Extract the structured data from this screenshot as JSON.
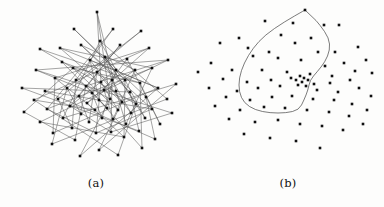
{
  "figure": {
    "background_color": "#fdfdfc",
    "node_color": "#101010",
    "edge_color": "#5a5a5a",
    "curve_color": "#444444",
    "caption_color": "#101010",
    "panels": [
      {
        "id": "a",
        "caption": "(a)",
        "description": "dense node-link hairball graph",
        "has_edges": true,
        "has_boundary_curve": false
      },
      {
        "id": "b",
        "caption": "(b)",
        "description": "scatter of same nodes with single closed boundary contour",
        "has_edges": false,
        "has_boundary_curve": true
      }
    ]
  },
  "chart_data": [
    {
      "type": "scatter",
      "panel": "a",
      "title": "(a)",
      "xlabel": "",
      "ylabel": "",
      "xlim": [
        0,
        192
      ],
      "ylim": [
        0,
        182
      ],
      "grid": false,
      "legend": null,
      "marker": "square",
      "marker_size": 2.6,
      "node_count": 78,
      "edge_count": 96,
      "nodes": [
        [
          97,
          12
        ],
        [
          74,
          29
        ],
        [
          113,
          29
        ],
        [
          141,
          31
        ],
        [
          40,
          49
        ],
        [
          60,
          48
        ],
        [
          81,
          45
        ],
        [
          100,
          41
        ],
        [
          120,
          45
        ],
        [
          149,
          48
        ],
        [
          62,
          62
        ],
        [
          36,
          70
        ],
        [
          73,
          68
        ],
        [
          90,
          60
        ],
        [
          105,
          57
        ],
        [
          127,
          59
        ],
        [
          168,
          60
        ],
        [
          55,
          78
        ],
        [
          76,
          80
        ],
        [
          97,
          72
        ],
        [
          116,
          70
        ],
        [
          135,
          70
        ],
        [
          152,
          68
        ],
        [
          22,
          88
        ],
        [
          45,
          91
        ],
        [
          67,
          88
        ],
        [
          86,
          86
        ],
        [
          101,
          82
        ],
        [
          112,
          80
        ],
        [
          125,
          80
        ],
        [
          140,
          83
        ],
        [
          158,
          88
        ],
        [
          176,
          84
        ],
        [
          34,
          100
        ],
        [
          58,
          99
        ],
        [
          79,
          96
        ],
        [
          92,
          93
        ],
        [
          104,
          90
        ],
        [
          116,
          91
        ],
        [
          130,
          92
        ],
        [
          146,
          97
        ],
        [
          167,
          99
        ],
        [
          24,
          112
        ],
        [
          47,
          109
        ],
        [
          70,
          106
        ],
        [
          87,
          103
        ],
        [
          99,
          100
        ],
        [
          110,
          99
        ],
        [
          122,
          102
        ],
        [
          136,
          104
        ],
        [
          152,
          109
        ],
        [
          172,
          113
        ],
        [
          40,
          122
        ],
        [
          63,
          118
        ],
        [
          81,
          114
        ],
        [
          95,
          110
        ],
        [
          107,
          108
        ],
        [
          118,
          110
        ],
        [
          131,
          113
        ],
        [
          145,
          118
        ],
        [
          160,
          124
        ],
        [
          53,
          133
        ],
        [
          72,
          128
        ],
        [
          89,
          122
        ],
        [
          102,
          118
        ],
        [
          113,
          119
        ],
        [
          126,
          124
        ],
        [
          139,
          131
        ],
        [
          155,
          139
        ],
        [
          52,
          144
        ],
        [
          75,
          140
        ],
        [
          96,
          133
        ],
        [
          111,
          132
        ],
        [
          124,
          137
        ],
        [
          142,
          148
        ],
        [
          80,
          156
        ],
        [
          99,
          150
        ],
        [
          118,
          155
        ]
      ],
      "edges": [
        [
          0,
          27
        ],
        [
          0,
          38
        ],
        [
          0,
          47
        ],
        [
          1,
          29
        ],
        [
          1,
          40
        ],
        [
          2,
          18
        ],
        [
          2,
          43
        ],
        [
          3,
          25
        ],
        [
          3,
          34
        ],
        [
          4,
          30
        ],
        [
          4,
          49
        ],
        [
          5,
          31
        ],
        [
          5,
          48
        ],
        [
          6,
          39
        ],
        [
          6,
          50
        ],
        [
          7,
          41
        ],
        [
          7,
          53
        ],
        [
          8,
          35
        ],
        [
          8,
          44
        ],
        [
          9,
          33
        ],
        [
          9,
          45
        ],
        [
          10,
          28
        ],
        [
          10,
          56
        ],
        [
          11,
          36
        ],
        [
          11,
          51
        ],
        [
          12,
          42
        ],
        [
          12,
          57
        ],
        [
          13,
          46
        ],
        [
          13,
          58
        ],
        [
          14,
          49
        ],
        [
          14,
          59
        ],
        [
          15,
          37
        ],
        [
          15,
          60
        ],
        [
          16,
          26
        ],
        [
          16,
          52
        ],
        [
          17,
          55
        ],
        [
          17,
          61
        ],
        [
          18,
          47
        ],
        [
          18,
          62
        ],
        [
          19,
          48
        ],
        [
          19,
          63
        ],
        [
          20,
          44
        ],
        [
          20,
          64
        ],
        [
          21,
          45
        ],
        [
          21,
          65
        ],
        [
          22,
          43
        ],
        [
          22,
          66
        ],
        [
          23,
          39
        ],
        [
          23,
          67
        ],
        [
          24,
          50
        ],
        [
          24,
          68
        ],
        [
          25,
          54
        ],
        [
          25,
          69
        ],
        [
          26,
          56
        ],
        [
          26,
          70
        ],
        [
          27,
          57
        ],
        [
          27,
          71
        ],
        [
          28,
          58
        ],
        [
          28,
          72
        ],
        [
          29,
          59
        ],
        [
          29,
          73
        ],
        [
          30,
          60
        ],
        [
          30,
          74
        ],
        [
          31,
          61
        ],
        [
          31,
          75
        ],
        [
          32,
          53
        ],
        [
          32,
          76
        ],
        [
          33,
          55
        ],
        [
          33,
          77
        ],
        [
          34,
          62
        ],
        [
          35,
          63
        ],
        [
          36,
          64
        ],
        [
          37,
          65
        ],
        [
          38,
          66
        ],
        [
          39,
          67
        ],
        [
          40,
          68
        ],
        [
          41,
          69
        ],
        [
          42,
          70
        ],
        [
          43,
          71
        ],
        [
          44,
          72
        ],
        [
          45,
          73
        ],
        [
          46,
          74
        ],
        [
          47,
          75
        ],
        [
          48,
          76
        ],
        [
          49,
          77
        ],
        [
          50,
          71
        ],
        [
          51,
          72
        ],
        [
          52,
          73
        ],
        [
          6,
          21
        ],
        [
          7,
          20
        ],
        [
          12,
          30
        ],
        [
          13,
          31
        ],
        [
          14,
          28
        ],
        [
          5,
          22
        ],
        [
          9,
          17
        ],
        [
          11,
          16
        ]
      ]
    },
    {
      "type": "scatter",
      "panel": "b",
      "title": "(b)",
      "xlabel": "",
      "ylabel": "",
      "xlim": [
        0,
        192
      ],
      "ylim": [
        0,
        182
      ],
      "grid": false,
      "legend": null,
      "marker": "square",
      "marker_size": 2.6,
      "node_count": 78,
      "nodes": [
        [
          113,
          10
        ],
        [
          73,
          21
        ],
        [
          101,
          23
        ],
        [
          132,
          25
        ],
        [
          47,
          38
        ],
        [
          89,
          35
        ],
        [
          119,
          38
        ],
        [
          147,
          25
        ],
        [
          28,
          43
        ],
        [
          77,
          52
        ],
        [
          56,
          48
        ],
        [
          103,
          43
        ],
        [
          126,
          52
        ],
        [
          143,
          52
        ],
        [
          166,
          47
        ],
        [
          19,
          63
        ],
        [
          61,
          56
        ],
        [
          86,
          58
        ],
        [
          109,
          60
        ],
        [
          133,
          66
        ],
        [
          152,
          63
        ],
        [
          174,
          60
        ],
        [
          40,
          70
        ],
        [
          70,
          70
        ],
        [
          95,
          72
        ],
        [
          118,
          74
        ],
        [
          140,
          76
        ],
        [
          163,
          71
        ],
        [
          6,
          72
        ],
        [
          31,
          79
        ],
        [
          55,
          82
        ],
        [
          79,
          80
        ],
        [
          99,
          78
        ],
        [
          108,
          76
        ],
        [
          112,
          78
        ],
        [
          116,
          80
        ],
        [
          110,
          82
        ],
        [
          104,
          80
        ],
        [
          122,
          84
        ],
        [
          138,
          83
        ],
        [
          158,
          80
        ],
        [
          180,
          73
        ],
        [
          17,
          88
        ],
        [
          45,
          91
        ],
        [
          66,
          88
        ],
        [
          88,
          86
        ],
        [
          106,
          85
        ],
        [
          114,
          86
        ],
        [
          125,
          90
        ],
        [
          146,
          92
        ],
        [
          167,
          88
        ],
        [
          34,
          97
        ],
        [
          58,
          100
        ],
        [
          80,
          97
        ],
        [
          100,
          96
        ],
        [
          121,
          99
        ],
        [
          142,
          100
        ],
        [
          160,
          104
        ],
        [
          179,
          96
        ],
        [
          23,
          106
        ],
        [
          48,
          110
        ],
        [
          72,
          107
        ],
        [
          93,
          108
        ],
        [
          115,
          110
        ],
        [
          137,
          112
        ],
        [
          157,
          116
        ],
        [
          175,
          110
        ],
        [
          37,
          119
        ],
        [
          63,
          122
        ],
        [
          86,
          120
        ],
        [
          108,
          124
        ],
        [
          130,
          126
        ],
        [
          151,
          130
        ],
        [
          171,
          124
        ],
        [
          52,
          134
        ],
        [
          78,
          138
        ],
        [
          104,
          141
        ],
        [
          128,
          148
        ]
      ],
      "boundary_curve": {
        "closed": true,
        "points": [
          [
            113,
            10
          ],
          [
            92,
            22
          ],
          [
            73,
            35
          ],
          [
            61,
            48
          ],
          [
            52,
            63
          ],
          [
            47,
            78
          ],
          [
            47,
            92
          ],
          [
            52,
            103
          ],
          [
            63,
            110
          ],
          [
            78,
            113
          ],
          [
            94,
            113
          ],
          [
            107,
            110
          ],
          [
            112,
            100
          ],
          [
            116,
            90
          ],
          [
            118,
            80
          ],
          [
            125,
            72
          ],
          [
            133,
            62
          ],
          [
            138,
            50
          ],
          [
            137,
            38
          ],
          [
            128,
            25
          ],
          [
            120,
            16
          ]
        ]
      }
    }
  ]
}
